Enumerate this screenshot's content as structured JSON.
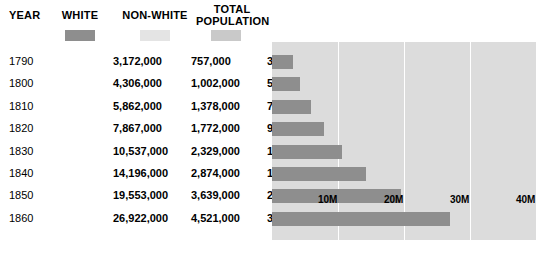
{
  "table": {
    "headers": {
      "year": "YEAR",
      "white": "WHITE",
      "nonwhite": "NON-WHITE",
      "total": "TOTAL\nPOPULATION"
    },
    "rows": [
      {
        "year": "1790",
        "white": "3,172,000",
        "nonwhite": "757,000",
        "total": "3,929,000"
      },
      {
        "year": "1800",
        "white": "4,306,000",
        "nonwhite": "1,002,000",
        "total": "5,308,000"
      },
      {
        "year": "1810",
        "white": "5,862,000",
        "nonwhite": "1,378,000",
        "total": "7,240,000"
      },
      {
        "year": "1820",
        "white": "7,867,000",
        "nonwhite": "1,772,000",
        "total": "9,639,000"
      },
      {
        "year": "1830",
        "white": "10,537,000",
        "nonwhite": "2,329,000",
        "total": "12,866,000"
      },
      {
        "year": "1840",
        "white": "14,196,000",
        "nonwhite": "2,874,000",
        "total": "17,070,000"
      },
      {
        "year": "1850",
        "white": "19,553,000",
        "nonwhite": "3,639,000",
        "total": "23,192,000"
      },
      {
        "year": "1860",
        "white": "26,922,000",
        "nonwhite": "4,521,000",
        "total": "31,443,000"
      }
    ]
  },
  "chart_data": {
    "type": "bar",
    "orientation": "horizontal",
    "title": "",
    "xlabel": "",
    "ylabel": "",
    "categories": [
      "1790",
      "1800",
      "1810",
      "1820",
      "1830",
      "1840",
      "1850",
      "1860"
    ],
    "series": [
      {
        "name": "WHITE",
        "color": "#8e8e8e",
        "values": [
          3172000,
          4306000,
          5862000,
          7867000,
          10537000,
          14196000,
          19553000,
          26922000
        ]
      },
      {
        "name": "NON-WHITE",
        "color": "#e4e4e4",
        "values": [
          757000,
          1002000,
          1378000,
          1772000,
          2329000,
          2874000,
          3639000,
          4521000
        ]
      },
      {
        "name": "TOTAL POPULATION",
        "color": "#c9c9c9",
        "values": [
          3929000,
          5308000,
          7240000,
          9639000,
          12866000,
          17070000,
          23192000,
          31443000
        ]
      }
    ],
    "plotted_series": "WHITE",
    "xlim": [
      0,
      40000000
    ],
    "xticks": [
      10000000,
      20000000,
      30000000,
      40000000
    ],
    "xtick_labels": [
      "10M",
      "20M",
      "30M",
      "40M"
    ],
    "grid": true,
    "legend_position": "top",
    "plot_background": "#dcdcdc",
    "gridline_color": "#ffffff"
  }
}
